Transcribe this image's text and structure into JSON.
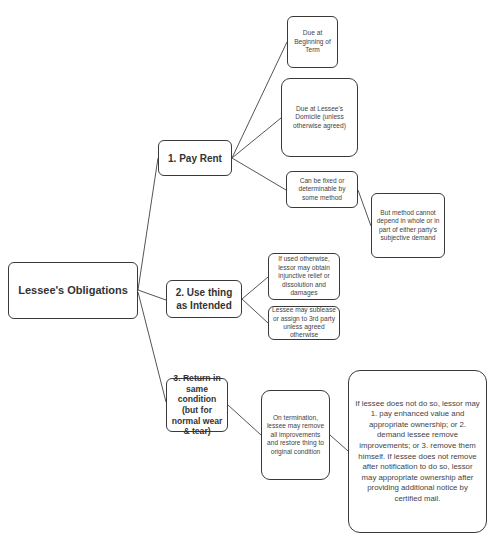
{
  "header": {
    "text": "Lessee's Obligations"
  },
  "root": {
    "label": "Lessee's Obligations"
  },
  "branches": [
    {
      "label": "1. Pay Rent",
      "children": [
        {
          "label": "Due at Beginning of Term"
        },
        {
          "label": "Due at Lessee's Domicile (unless otherwise agreed)"
        },
        {
          "label": "Can be fixed or determinable by some method",
          "children": [
            {
              "label": "But method cannot depend in whole or in part of either party's subjective demand"
            }
          ]
        }
      ]
    },
    {
      "label": "2. Use thing as Intended",
      "children": [
        {
          "label": "If used otherwise, lessor may obtain injunctive relief or dissolution and damages"
        },
        {
          "label": "Lessee may sublease or assign to 3rd party unless agreed otherwise"
        }
      ]
    },
    {
      "label": "3. Return in same condition (but for normal wear & tear)",
      "children": [
        {
          "label": "On termination, lessee may remove all improvements and restore thing to original condition",
          "children": [
            {
              "label": "If lessee does not do so, lessor may 1. pay enhanced value and appropriate ownership; or 2. demand lessee remove improvements; or 3. remove them himself.  If lessee does not remove after notification to do so, lessor may appropriate ownership after providing additional notice by certified mail."
            }
          ]
        }
      ]
    }
  ],
  "colors": {
    "stroke": "#3a3a3a",
    "background": "#ffffff",
    "text": "#404040"
  }
}
